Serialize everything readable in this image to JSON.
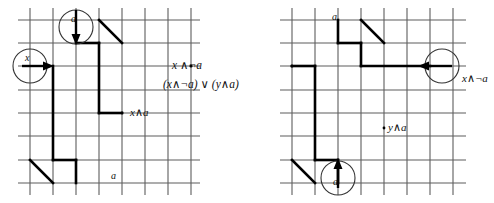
{
  "figure": {
    "type": "two-panel-grid-diagram",
    "background": "#ffffff",
    "grid_color": "#5d5d5d",
    "path_color": "#000000",
    "circle_color": "#333333",
    "width": 494,
    "height": 203
  },
  "left_panel": {
    "name": "left-grid-panel",
    "grid": {
      "x": 18,
      "y": 20,
      "cols": 8,
      "rows": 7,
      "cell": 23.2
    },
    "annotations": {
      "top_circle_label": "a",
      "left_circle_label": "x",
      "path_label": "x∧a",
      "bottom_label": "a"
    },
    "arrows": [
      {
        "name": "a-input-arrow",
        "direction": "down",
        "label": "a"
      },
      {
        "name": "x-input-arrow",
        "direction": "right",
        "label": "x"
      }
    ]
  },
  "middle_text": {
    "line1": "x ∧¬a",
    "line2": "(x∧¬a) ∨ (y∧a)"
  },
  "right_panel": {
    "name": "right-grid-panel",
    "grid": {
      "x": 290,
      "y": 20,
      "cols": 8,
      "rows": 7,
      "cell": 23.2
    },
    "annotations": {
      "top_label": "a",
      "right_circle_label": "x∧¬a",
      "path_label": "y∧a",
      "bottom_circle_label": "a"
    },
    "arrows": [
      {
        "name": "x-not-a-output-arrow",
        "direction": "left",
        "label": "x∧¬a"
      },
      {
        "name": "a-input-arrow",
        "direction": "up",
        "label": "a"
      }
    ]
  }
}
